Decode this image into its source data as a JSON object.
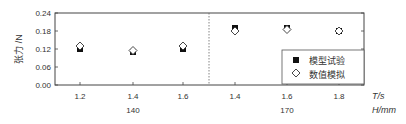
{
  "chart_data": {
    "type": "scatter",
    "title": "",
    "ylabel": "张力 /N",
    "xlabel_primary": "T/s",
    "xlabel_secondary": "H/mm",
    "ylim": [
      0.0,
      0.24
    ],
    "yticks": [
      "0.00",
      "0.06",
      "0.12",
      "0.18",
      "0.24"
    ],
    "grid": false,
    "legend_position": "lower right",
    "groups": [
      {
        "H": "140",
        "T": [
          "1.2",
          "1.4",
          "1.6"
        ]
      },
      {
        "H": "170",
        "T": [
          "1.4",
          "1.6",
          "1.8"
        ]
      }
    ],
    "categories": [
      "1.2",
      "1.4",
      "1.6",
      "1.4",
      "1.6",
      "1.8"
    ],
    "series": [
      {
        "name": "模型试验",
        "marker": "filled-square",
        "values": [
          0.12,
          0.11,
          0.12,
          0.19,
          0.19,
          0.18
        ]
      },
      {
        "name": "数值模拟",
        "marker": "open-diamond",
        "values": [
          0.13,
          0.115,
          0.13,
          0.18,
          0.185,
          0.18
        ]
      }
    ]
  },
  "axis": {
    "ylabel": "张力 /N",
    "x_unit_T": "T/s",
    "x_unit_H": "H/mm"
  },
  "legend": {
    "items": [
      {
        "label": "模型试验"
      },
      {
        "label": "数值模拟"
      }
    ]
  }
}
